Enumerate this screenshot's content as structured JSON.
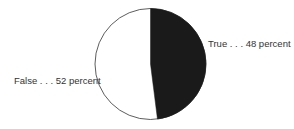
{
  "chart_data": {
    "type": "pie",
    "title": "",
    "slices": [
      {
        "label": "True",
        "value": 48,
        "unit": "percent",
        "color": "#1a1a1a",
        "annotation": "True . . . 48 percent"
      },
      {
        "label": "False",
        "value": 52,
        "unit": "percent",
        "color": "#ffffff",
        "annotation": "False . . . 52 percent"
      }
    ],
    "legend": "none (direct labels)",
    "outline_color": "#333333"
  },
  "labels": {
    "true": "True . . . 48 percent",
    "false": "False . . . 52 percent"
  }
}
